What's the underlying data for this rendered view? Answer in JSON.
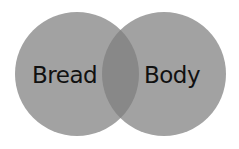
{
  "diagram": {
    "type": "venn",
    "sets": [
      {
        "label": "Bread",
        "color": "#a2a2a2"
      },
      {
        "label": "Body",
        "color": "#a2a2a2"
      }
    ],
    "overlap_color": "#888888"
  }
}
